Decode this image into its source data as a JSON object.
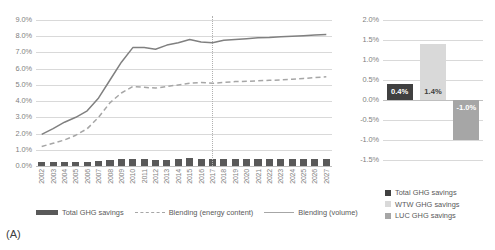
{
  "chart_data": [
    {
      "panel": "A",
      "tag": "(A)",
      "type": "line",
      "title": "",
      "xlabel": "",
      "ylabel": "",
      "ylim": [
        0.0,
        9.0
      ],
      "yticks": [
        "0.0%",
        "1.0%",
        "2.0%",
        "3.0%",
        "4.0%",
        "5.0%",
        "6.0%",
        "7.0%",
        "8.0%",
        "9.0%"
      ],
      "grid": true,
      "legend_position": "bottom",
      "categories": [
        "2002",
        "2003",
        "2004",
        "2005",
        "2006",
        "2007",
        "2008",
        "2009",
        "2010",
        "2011",
        "2012",
        "2013",
        "2014",
        "2015",
        "2016",
        "2017",
        "2018",
        "2019",
        "2020",
        "2021",
        "2022",
        "2023",
        "2024",
        "2025",
        "2026",
        "2027"
      ],
      "annotation": "vertical dotted divider at 2017 (historic vs projection)",
      "series": [
        {
          "name": "Total GHG savings",
          "style": "bar",
          "color": "#595959",
          "values": [
            0.22,
            0.22,
            0.22,
            0.22,
            0.25,
            0.3,
            0.4,
            0.42,
            0.42,
            0.42,
            0.4,
            0.4,
            0.42,
            0.48,
            0.45,
            0.45,
            0.45,
            0.45,
            0.45,
            0.45,
            0.45,
            0.45,
            0.45,
            0.45,
            0.45,
            0.45
          ]
        },
        {
          "name": "Blending (energy content)",
          "style": "dashed-line",
          "color": "#a6a6a6",
          "values": [
            1.2,
            1.4,
            1.6,
            1.9,
            2.3,
            3.0,
            3.9,
            4.5,
            4.9,
            4.85,
            4.8,
            4.9,
            5.0,
            5.1,
            5.15,
            5.1,
            5.15,
            5.2,
            5.22,
            5.25,
            5.28,
            5.3,
            5.35,
            5.4,
            5.45,
            5.5
          ]
        },
        {
          "name": "Blending (volume)",
          "style": "solid-line",
          "color": "#808080",
          "values": [
            1.95,
            2.3,
            2.7,
            3.0,
            3.4,
            4.2,
            5.3,
            6.4,
            7.3,
            7.3,
            7.2,
            7.45,
            7.6,
            7.8,
            7.65,
            7.6,
            7.75,
            7.8,
            7.85,
            7.9,
            7.93,
            7.97,
            8.0,
            8.03,
            8.07,
            8.1
          ]
        }
      ]
    },
    {
      "panel": "B",
      "tag": "(B)",
      "type": "bar",
      "title": "",
      "xlabel": "",
      "ylabel": "",
      "ylim": [
        -1.5,
        2.0
      ],
      "yticks": [
        "2.0%",
        "1.5%",
        "1.0%",
        "0.5%",
        "0.0%",
        "-0.5%",
        "-1.0%",
        "-1.5%"
      ],
      "grid": true,
      "legend_position": "bottom",
      "categories": [
        "Total GHG savings",
        "WTW GHG savings",
        "LUC GHG savings"
      ],
      "values": [
        0.4,
        1.4,
        -1.0
      ],
      "data_labels": [
        "0.4%",
        "1.4%",
        "-1.0%"
      ],
      "colors": [
        "#404040",
        "#d9d9d9",
        "#a6a6a6"
      ]
    }
  ],
  "panelA": {
    "tag": "(A)",
    "yticks": [
      "9.0%",
      "8.0%",
      "7.0%",
      "6.0%",
      "5.0%",
      "4.0%",
      "3.0%",
      "2.0%",
      "1.0%",
      "0.0%"
    ],
    "years": [
      "2002",
      "2003",
      "2004",
      "2005",
      "2006",
      "2007",
      "2008",
      "2009",
      "2010",
      "2011",
      "2012",
      "2013",
      "2014",
      "2015",
      "2016",
      "2017",
      "2018",
      "2019",
      "2020",
      "2021",
      "2022",
      "2023",
      "2024",
      "2025",
      "2026",
      "2027"
    ],
    "legend": [
      {
        "label": "Total GHG savings",
        "marker": "bar"
      },
      {
        "label": "Blending (energy content)",
        "marker": "dashed"
      },
      {
        "label": "Blending (volume)",
        "marker": "solid"
      }
    ]
  },
  "panelB": {
    "tag": "(B)",
    "yticks": [
      "2.0%",
      "1.5%",
      "1.0%",
      "0.5%",
      "0.0%",
      "-0.5%",
      "-1.0%",
      "-1.5%"
    ],
    "labels": [
      "0.4%",
      "1.4%",
      "-1.0%"
    ],
    "legend": [
      {
        "label": "Total GHG savings",
        "color": "#404040"
      },
      {
        "label": "WTW GHG savings",
        "color": "#d9d9d9"
      },
      {
        "label": "LUC GHG savings",
        "color": "#a6a6a6"
      }
    ]
  }
}
